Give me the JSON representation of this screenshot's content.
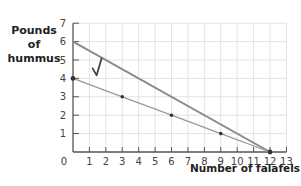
{
  "chart_data": {
    "type": "line",
    "title": "",
    "xlabel": "Number of falafels",
    "ylabel": "Pounds of hummus",
    "ylabel_lines": [
      "Pounds",
      "of",
      "hummus"
    ],
    "xlim": [
      0,
      13
    ],
    "ylim": [
      0,
      7
    ],
    "x_ticks": [
      "0",
      "1",
      "2",
      "3",
      "4",
      "5",
      "6",
      "7",
      "8",
      "9",
      "10",
      "11",
      "12",
      "13"
    ],
    "y_ticks": [
      "1",
      "2",
      "3",
      "4",
      "5",
      "6",
      "7"
    ],
    "grid": true,
    "series": [
      {
        "name": "Line A (upper)",
        "x": [
          0,
          12
        ],
        "y": [
          6,
          0
        ],
        "color": "#8a8a8a",
        "markers": false
      },
      {
        "name": "Line B (lower)",
        "x": [
          0,
          3,
          6,
          9,
          12
        ],
        "y": [
          4,
          3,
          2,
          1,
          0
        ],
        "color": "#9a9a9a",
        "markers": true
      }
    ],
    "annotations": [
      {
        "type": "checkmark",
        "x": 1.5,
        "y": 4.6,
        "text": "√"
      }
    ]
  }
}
